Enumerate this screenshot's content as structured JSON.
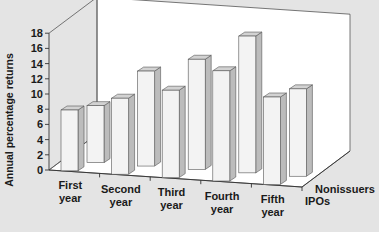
{
  "chart_data": {
    "type": "bar",
    "style": "3d-clustered",
    "title": "",
    "xlabel": "",
    "ylabel": "Annual percentage returns",
    "ylim": [
      0,
      18
    ],
    "yticks": [
      0,
      2,
      4,
      6,
      8,
      10,
      12,
      14,
      16,
      18
    ],
    "categories": [
      [
        "First",
        "year"
      ],
      [
        "Second",
        "year"
      ],
      [
        "Third",
        "year"
      ],
      [
        "Fourth",
        "year"
      ],
      [
        "Fifth",
        "year"
      ]
    ],
    "series": [
      {
        "name": "IPOs",
        "values": [
          8,
          10,
          11.5,
          14.5,
          11.5
        ]
      },
      {
        "name": "Nonissuers",
        "values": [
          7.5,
          12.5,
          14.5,
          18,
          11.5
        ]
      }
    ],
    "grid": false,
    "legend_position": "depth-axis labels at right"
  },
  "colors": {
    "background": "#e4e4e4",
    "panel": "#ffffff",
    "bar_front": "#f3f3f3",
    "bar_top": "#d2d2d2",
    "bar_side": "#bcbcbc",
    "outline": "#555555"
  }
}
